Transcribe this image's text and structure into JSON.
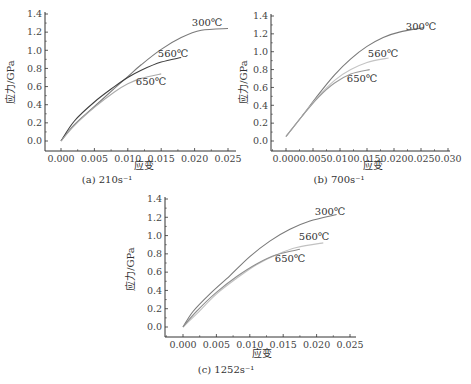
{
  "chart_data": [
    {
      "type": "line",
      "caption": "(a) 210s⁻¹",
      "xlabel": "应变",
      "ylabel": "应力/GPa",
      "xlim": [
        -0.003,
        0.025
      ],
      "ylim": [
        -0.1,
        1.4
      ],
      "xticks": [
        "0.000",
        "0.005",
        "0.010",
        "0.015",
        "0.020",
        "0.025"
      ],
      "yticks": [
        "0.0",
        "0.2",
        "0.4",
        "0.6",
        "0.8",
        "1.0",
        "1.2",
        "1.4"
      ],
      "grid": false,
      "series": [
        {
          "name": "300℃",
          "color": "#7a7a7a",
          "x": [
            0.0,
            0.002,
            0.005,
            0.008,
            0.01,
            0.012,
            0.015,
            0.018,
            0.021,
            0.025
          ],
          "y": [
            0.0,
            0.18,
            0.38,
            0.58,
            0.71,
            0.84,
            1.01,
            1.14,
            1.22,
            1.24
          ]
        },
        {
          "name": "560℃",
          "color": "#3f3f3f",
          "x": [
            0.0,
            0.002,
            0.005,
            0.008,
            0.01,
            0.012,
            0.015,
            0.018
          ],
          "y": [
            0.0,
            0.22,
            0.43,
            0.6,
            0.7,
            0.78,
            0.87,
            0.92
          ]
        },
        {
          "name": "650℃",
          "color": "#ababab",
          "x": [
            0.0,
            0.002,
            0.005,
            0.008,
            0.01,
            0.012,
            0.015
          ],
          "y": [
            0.0,
            0.17,
            0.37,
            0.54,
            0.63,
            0.69,
            0.74
          ]
        }
      ]
    },
    {
      "type": "line",
      "caption": "(b) 700s⁻¹",
      "xlabel": "应变",
      "ylabel": "应力/GPa",
      "xlim": [
        -0.003,
        0.03
      ],
      "ylim": [
        -0.1,
        1.4
      ],
      "xticks": [
        "0.000",
        "0.005",
        "0.010",
        "0.015",
        "0.020",
        "0.025",
        "0.030"
      ],
      "yticks": [
        "0.0",
        "0.2",
        "0.4",
        "0.6",
        "0.8",
        "1.0",
        "1.2",
        "1.4"
      ],
      "grid": false,
      "series": [
        {
          "name": "300℃",
          "color": "#7a7a7a",
          "x": [
            0.0,
            0.003,
            0.006,
            0.009,
            0.012,
            0.015,
            0.018,
            0.021,
            0.0255
          ],
          "y": [
            0.05,
            0.28,
            0.52,
            0.74,
            0.92,
            1.06,
            1.16,
            1.22,
            1.27
          ]
        },
        {
          "name": "560℃",
          "color": "#c4c4c4",
          "x": [
            0.0,
            0.003,
            0.006,
            0.009,
            0.012,
            0.015,
            0.019
          ],
          "y": [
            0.05,
            0.28,
            0.5,
            0.68,
            0.8,
            0.88,
            0.93
          ]
        },
        {
          "name": "650℃",
          "color": "#9a9a9a",
          "x": [
            0.0,
            0.003,
            0.006,
            0.009,
            0.012,
            0.0155
          ],
          "y": [
            0.05,
            0.28,
            0.49,
            0.65,
            0.75,
            0.8
          ]
        }
      ]
    },
    {
      "type": "line",
      "caption": "(c) 1252s⁻¹",
      "xlabel": "应变",
      "ylabel": "应力/GPa",
      "xlim": [
        -0.003,
        0.025
      ],
      "ylim": [
        -0.1,
        1.4
      ],
      "xticks": [
        "0.000",
        "0.005",
        "0.010",
        "0.015",
        "0.020",
        "0.025"
      ],
      "yticks": [
        "0.0",
        "0.2",
        "0.4",
        "0.6",
        "0.8",
        "1.0",
        "1.2",
        "1.4"
      ],
      "grid": false,
      "series": [
        {
          "name": "300℃",
          "color": "#7a7a7a",
          "x": [
            0.0,
            0.0015,
            0.004,
            0.007,
            0.01,
            0.013,
            0.016,
            0.019,
            0.023
          ],
          "y": [
            0.0,
            0.17,
            0.36,
            0.56,
            0.77,
            0.94,
            1.07,
            1.16,
            1.23
          ]
        },
        {
          "name": "560℃",
          "color": "#c2c2c2",
          "x": [
            0.0,
            0.002,
            0.005,
            0.008,
            0.011,
            0.014,
            0.017,
            0.021
          ],
          "y": [
            0.0,
            0.14,
            0.36,
            0.53,
            0.68,
            0.79,
            0.87,
            0.92
          ]
        },
        {
          "name": "650℃",
          "color": "#8f8f8f",
          "x": [
            0.0,
            0.002,
            0.005,
            0.008,
            0.011,
            0.014,
            0.0175
          ],
          "y": [
            0.0,
            0.17,
            0.38,
            0.55,
            0.69,
            0.79,
            0.85
          ]
        }
      ]
    }
  ],
  "layout": {
    "panels": [
      {
        "plot": {
          "x0": 45,
          "xEnd": 236,
          "yAxisTop": 12,
          "xAxisY": 151,
          "y14": 14,
          "y0": 141,
          "xZero": 61,
          "dx": 33.4
        },
        "labels": [
          {
            "series": 0,
            "x": 207,
            "y": 26
          },
          {
            "series": 1,
            "x": 173,
            "y": 57
          },
          {
            "series": 2,
            "x": 151,
            "y": 85
          }
        ],
        "caption_xy": [
          107,
          183
        ],
        "xlabel_xy": [
          144,
          169
        ],
        "ylabel_xy": [
          14,
          82
        ]
      },
      {
        "plot": {
          "x0": 271,
          "xEnd": 450,
          "yAxisTop": 14,
          "xAxisY": 151,
          "y14": 16,
          "y0": 141,
          "xZero": 286,
          "dx": 27
        },
        "labels": [
          {
            "series": 0,
            "x": 421,
            "y": 30
          },
          {
            "series": 1,
            "x": 383,
            "y": 57
          },
          {
            "series": 2,
            "x": 362,
            "y": 82
          }
        ],
        "caption_xy": [
          339,
          183
        ],
        "xlabel_xy": [
          373,
          169
        ],
        "ylabel_xy": [
          247,
          82
        ]
      },
      {
        "plot": {
          "x0": 165,
          "xEnd": 356,
          "yAxisTop": 197,
          "xAxisY": 337,
          "y14": 199,
          "y0": 327,
          "xZero": 183,
          "dx": 33.4
        },
        "labels": [
          {
            "series": 0,
            "x": 330,
            "y": 215
          },
          {
            "series": 1,
            "x": 314,
            "y": 240
          },
          {
            "series": 2,
            "x": 290,
            "y": 262
          }
        ],
        "caption_xy": [
          226,
          373
        ],
        "xlabel_xy": [
          262,
          357
        ],
        "ylabel_xy": [
          134,
          269
        ]
      }
    ]
  }
}
